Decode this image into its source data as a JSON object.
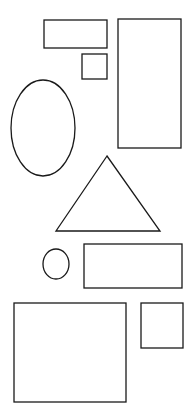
{
  "canvas": {
    "width": 194,
    "height": 416,
    "background": "#ffffff",
    "stroke": "#1a1a1a"
  },
  "shapes": [
    {
      "type": "rect",
      "name": "wide-rectangle",
      "x": 44,
      "y": 20,
      "w": 63,
      "h": 28
    },
    {
      "type": "rect",
      "name": "small-square-top",
      "x": 82,
      "y": 54,
      "w": 25,
      "h": 25
    },
    {
      "type": "rect",
      "name": "tall-rectangle",
      "x": 118,
      "y": 19,
      "w": 63,
      "h": 129
    },
    {
      "type": "ellipse",
      "name": "tall-ellipse",
      "cx": 43,
      "cy": 128,
      "rx": 32,
      "ry": 48
    },
    {
      "type": "triangle",
      "name": "triangle",
      "points": "107,156 56,231 160,231"
    },
    {
      "type": "ellipse",
      "name": "small-circle",
      "cx": 56,
      "cy": 264,
      "rx": 13,
      "ry": 15
    },
    {
      "type": "rect",
      "name": "medium-rectangle",
      "x": 84,
      "y": 244,
      "w": 98,
      "h": 44
    },
    {
      "type": "rect",
      "name": "large-rectangle",
      "x": 14,
      "y": 303,
      "w": 112,
      "h": 99
    },
    {
      "type": "rect",
      "name": "small-square-bottom",
      "x": 141,
      "y": 303,
      "w": 42,
      "h": 45
    }
  ]
}
